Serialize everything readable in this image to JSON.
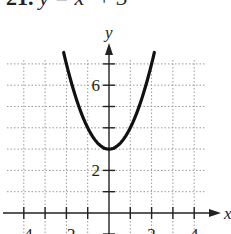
{
  "problem": {
    "number": "21.",
    "equation": "y = x² + 3"
  },
  "chart_data": {
    "type": "line",
    "title": "y = x² + 3",
    "function": "x^2 + 3",
    "xlabel": "x",
    "ylabel": "y",
    "xlim": [
      -4.5,
      4.3
    ],
    "ylim": [
      -0.5,
      7.5
    ],
    "x_ticks": [
      -4,
      -3,
      -2,
      -1,
      0,
      1,
      2,
      3,
      4
    ],
    "x_tick_labels": [
      "−4",
      "−2",
      "2",
      "4"
    ],
    "x_tick_label_values": [
      -4,
      -2,
      2,
      4
    ],
    "y_ticks": [
      1,
      2,
      3,
      4,
      5,
      6,
      7
    ],
    "y_tick_labels": [
      "2",
      "6"
    ],
    "y_tick_label_values": [
      2,
      6
    ],
    "grid": true,
    "grid_style": "dotted",
    "series": [
      {
        "name": "y = x² + 3",
        "x": [
          -2.1,
          -2,
          -1.5,
          -1,
          -0.5,
          0,
          0.5,
          1,
          1.5,
          2,
          2.1
        ],
        "y": [
          7.41,
          7,
          5.25,
          4,
          3.25,
          3,
          3.25,
          4,
          5.25,
          7,
          7.41
        ]
      }
    ],
    "vertex": [
      0,
      3
    ]
  },
  "colors": {
    "curve": "#111111",
    "axis": "#222222",
    "grid": "#9a9a9a",
    "background": "#ffffff"
  }
}
